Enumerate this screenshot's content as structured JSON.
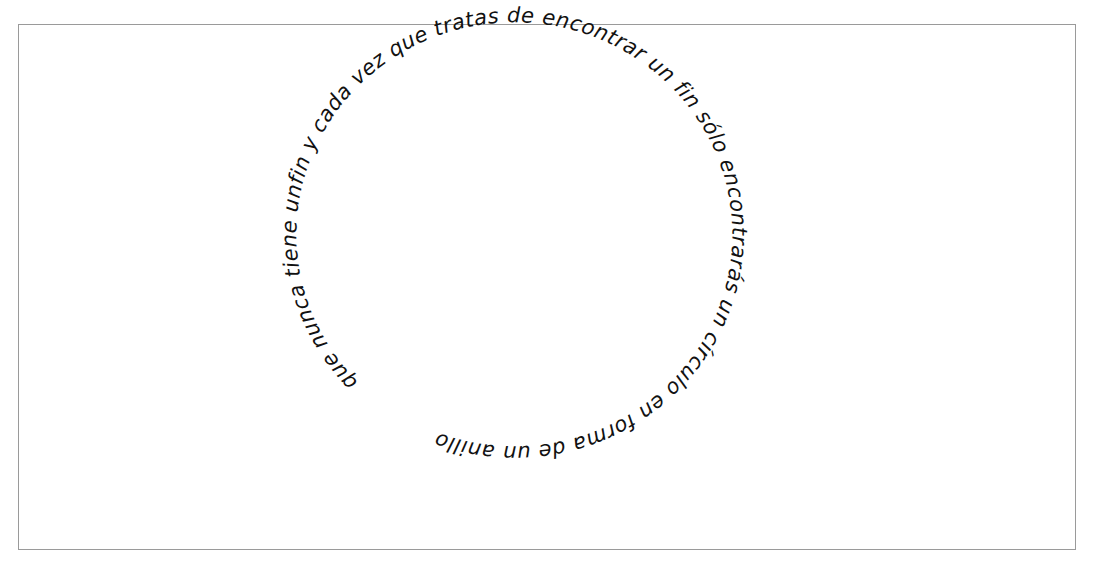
{
  "artwork": {
    "type": "circular-handwritten-text",
    "text": "que nunca tiene un fin y cada vez que tratas de encontrar un fin sólo encontrarás un círculo en forma de un anillo",
    "text_as_written": "que nunca tiene unfin y cada vez que tratas de encontrar un fin sólo encontrarás un círculo en forma de un anillo",
    "direction": "clockwise",
    "ink_color": "#111111",
    "frame_color": "#9a9a9a",
    "background_color": "#ffffff"
  }
}
